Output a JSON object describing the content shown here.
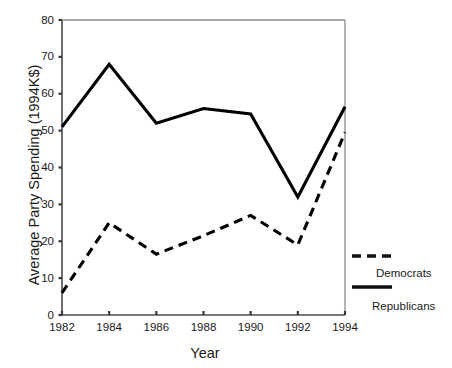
{
  "chart_data": {
    "type": "line",
    "title": "",
    "xlabel": "Year",
    "ylabel": "Average Party Spending (1994K$)",
    "x": [
      1982,
      1984,
      1986,
      1988,
      1990,
      1992,
      1994
    ],
    "xtick_labels": [
      "1982",
      "1984",
      "1986",
      "1988",
      "1990",
      "1992",
      "1994"
    ],
    "ytick_labels": [
      "0",
      "10",
      "20",
      "30",
      "40",
      "50",
      "60",
      "70",
      "80"
    ],
    "ytick_values": [
      0,
      10,
      20,
      30,
      40,
      50,
      60,
      70,
      80
    ],
    "xlim": [
      1982,
      1994
    ],
    "ylim": [
      0,
      80
    ],
    "grid": false,
    "legend_position": "right",
    "series": [
      {
        "name": "Democrats",
        "style": "dashed",
        "color": "#000000",
        "values": [
          6,
          25,
          16.5,
          21.5,
          27,
          19,
          49.5
        ]
      },
      {
        "name": "Republicans",
        "style": "solid",
        "color": "#000000",
        "values": [
          51,
          68,
          52,
          56,
          54.5,
          32,
          56.5
        ]
      }
    ]
  },
  "legend": {
    "items": [
      {
        "label": "Democrats",
        "style": "dashed"
      },
      {
        "label": "Republicans",
        "style": "solid"
      }
    ]
  },
  "axes": {
    "y_title": "Average Party Spending (1994K$)",
    "x_title": "Year"
  },
  "ghost": {
    "text": ""
  }
}
